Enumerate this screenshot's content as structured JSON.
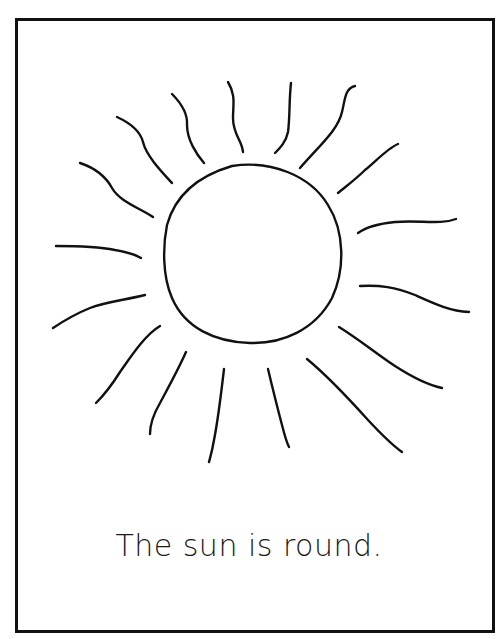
{
  "worksheet": {
    "caption": "The sun is round.",
    "drawing": {
      "subject": "sun",
      "stroke_color": "#111111",
      "border_color": "#111111",
      "background": "#ffffff",
      "ray_count": 17
    }
  }
}
